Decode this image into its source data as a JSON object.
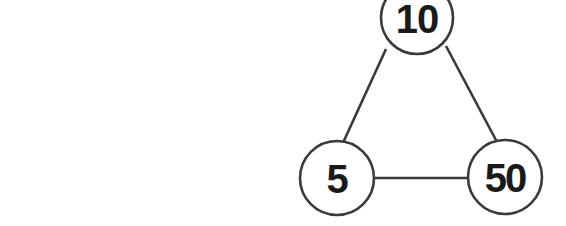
{
  "diagram": {
    "type": "graph",
    "background_color": "#ffffff",
    "stroke_color": "#3a3a3a",
    "label_color": "#1a1a1a",
    "nodes": [
      {
        "id": "top",
        "label": "10",
        "cx": 417,
        "cy": 18,
        "r": 36
      },
      {
        "id": "bottom-left",
        "label": "5",
        "cx": 337,
        "cy": 178,
        "r": 37
      },
      {
        "id": "bottom-right",
        "label": "50",
        "cx": 505,
        "cy": 177,
        "r": 37
      }
    ],
    "edges": [
      {
        "id": "top-to-bottom-left",
        "from": "top",
        "to": "bottom-left",
        "x1": 386,
        "y1": 49,
        "x2": 342,
        "y2": 145
      },
      {
        "id": "top-to-bottom-right",
        "from": "top",
        "to": "bottom-right",
        "x1": 446,
        "y1": 46,
        "x2": 497,
        "y2": 142
      },
      {
        "id": "bottom-left-to-bottom-right",
        "from": "bottom-left",
        "to": "bottom-right",
        "x1": 374,
        "y1": 178,
        "x2": 468,
        "y2": 178
      }
    ]
  }
}
